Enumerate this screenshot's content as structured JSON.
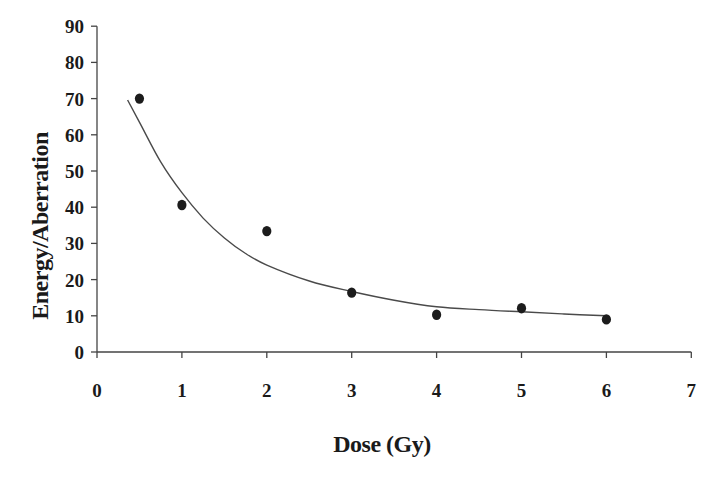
{
  "chart_data": {
    "type": "scatter",
    "title": "",
    "xlabel": "Dose (Gy)",
    "ylabel": "Energy/Aberration",
    "xlim": [
      0,
      7
    ],
    "ylim": [
      0,
      90
    ],
    "xticks": [
      0,
      1,
      2,
      3,
      4,
      5,
      6,
      7
    ],
    "yticks": [
      0,
      10,
      20,
      30,
      40,
      50,
      60,
      70,
      80,
      90
    ],
    "grid": false,
    "legend": null,
    "series": [
      {
        "name": "Measured",
        "kind": "scatter",
        "marker": "filled-circle",
        "x": [
          0.5,
          1,
          2,
          3,
          4,
          5,
          6
        ],
        "y": [
          70,
          40.6,
          33.4,
          16.4,
          10.3,
          12.1,
          9.0
        ]
      },
      {
        "name": "Fitted curve",
        "kind": "line",
        "x": [
          0.36,
          0.5,
          0.75,
          1.0,
          1.25,
          1.5,
          1.75,
          2.0,
          2.5,
          3.0,
          3.5,
          4.0,
          4.5,
          5.0,
          5.5,
          6.0
        ],
        "y": [
          69.6,
          63.5,
          52.5,
          44.0,
          37.0,
          31.5,
          27.2,
          24.0,
          19.6,
          16.7,
          14.3,
          12.5,
          11.7,
          11.1,
          10.5,
          10.0
        ]
      }
    ]
  },
  "colors": {
    "points": "#1c1c1c",
    "line": "#4a4a4a",
    "axis": "#444444",
    "text": "#1a1a1a",
    "background": "#ffffff"
  }
}
